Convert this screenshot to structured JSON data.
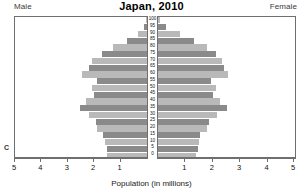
{
  "header": {
    "male_label": "Male",
    "female_label": "Female",
    "corner_mark": "C"
  },
  "chart_data": {
    "type": "bar",
    "subtype": "population-pyramid",
    "title": "Japan, 2010",
    "xlabel": "Population (in millions)",
    "ylabel": "",
    "grid": false,
    "legend": false,
    "xlim_left": [
      5,
      0
    ],
    "xlim_right": [
      0,
      5
    ],
    "xticks_left": [
      "5",
      "4",
      "3",
      "2",
      "1"
    ],
    "xticks_right": [
      "1",
      "2",
      "3",
      "4",
      "5"
    ],
    "categories": [
      "100",
      "95",
      "90",
      "85",
      "80",
      "75",
      "70",
      "65",
      "60",
      "55",
      "50",
      "45",
      "40",
      "35",
      "30",
      "25",
      "20",
      "15",
      "10",
      "5",
      "0"
    ],
    "series": [
      {
        "name": "Male",
        "side": "left",
        "values": [
          0.02,
          0.1,
          0.35,
          0.75,
          1.3,
          1.7,
          2.1,
          2.2,
          2.45,
          1.9,
          2.1,
          2.0,
          2.3,
          2.55,
          2.2,
          1.95,
          1.9,
          1.65,
          1.6,
          1.5,
          1.5
        ]
      },
      {
        "name": "Female",
        "side": "right",
        "values": [
          0.06,
          0.3,
          0.8,
          1.3,
          1.8,
          2.1,
          2.35,
          2.4,
          2.55,
          1.95,
          2.1,
          2.0,
          2.25,
          2.5,
          2.15,
          1.85,
          1.8,
          1.55,
          1.5,
          1.45,
          1.4
        ]
      }
    ],
    "colors": {
      "bar_dark": "#8a8a8a",
      "bar_light": "#b9b9b9",
      "axis": "#6f6f6f",
      "background": "#ffffff"
    }
  }
}
